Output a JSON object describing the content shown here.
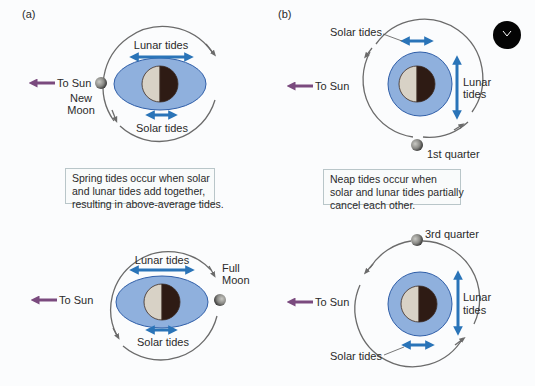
{
  "figure": {
    "panel_a_label": "(a)",
    "panel_b_label": "(b)",
    "colors": {
      "ocean_bulge": "#8fb0dd",
      "ocean_outline": "#2f5ea8",
      "tide_arrow": "#2a74b8",
      "sun_arrow": "#7a4a7e",
      "orbit": "#6b6b6b",
      "earth_light": "#d8d2c6",
      "earth_dark": "#2e1b14"
    },
    "panels": {
      "spring_new_moon": {
        "sun_label": "To Sun",
        "lunar_label": "Lunar tides",
        "solar_label": "Solar tides",
        "moon_label_line1": "New",
        "moon_label_line2": "Moon"
      },
      "neap_first_quarter": {
        "sun_label": "To Sun",
        "lunar_label_line1": "Lunar",
        "lunar_label_line2": "tides",
        "solar_label": "Solar tides",
        "moon_label": "1st quarter"
      },
      "spring_full_moon": {
        "sun_label": "To Sun",
        "lunar_label": "Lunar tides",
        "solar_label": "Solar tides",
        "moon_label_line1": "Full",
        "moon_label_line2": "Moon"
      },
      "neap_third_quarter": {
        "sun_label": "To Sun",
        "lunar_label_line1": "Lunar",
        "lunar_label_line2": "tides",
        "solar_label": "Solar tides",
        "moon_label": "3rd quarter"
      }
    },
    "captions": {
      "spring": {
        "line1": "Spring tides occur when solar",
        "line2": "and lunar tides add together,",
        "line3": "resulting in above-average tides."
      },
      "neap": {
        "line1": "Neap tides occur when",
        "line2": "solar and lunar tides partially",
        "line3": "cancel each other."
      }
    }
  }
}
